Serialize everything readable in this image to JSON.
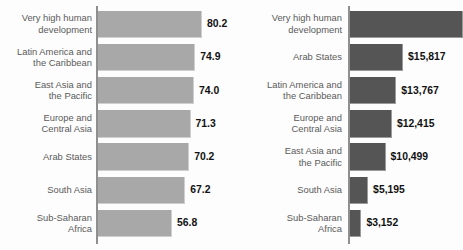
{
  "chart_data": [
    {
      "type": "bar",
      "id": "life-expectancy",
      "orientation": "horizontal",
      "title": "",
      "xlabel": "",
      "ylabel": "",
      "grid": false,
      "legend": null,
      "bar_color": "#a8a8a8",
      "axis_color": "#8f8f8f",
      "label_color": "#5b5b5b",
      "value_color": "#111111",
      "xlim": [
        0,
        80.2
      ],
      "categories": [
        "Very high human development",
        "Latin America and the Caribbean",
        "East Asia and the Pacific",
        "Europe and Central Asia",
        "Arab States",
        "South Asia",
        "Sub-Saharan Africa"
      ],
      "category_lines": [
        [
          "Very high human",
          "development"
        ],
        [
          "Latin America and",
          "the Caribbean"
        ],
        [
          "East Asia and",
          "the Pacific"
        ],
        [
          "Europe and",
          "Central Asia"
        ],
        [
          "Arab States"
        ],
        [
          "South Asia"
        ],
        [
          "Sub-Saharan",
          "Africa"
        ]
      ],
      "values": [
        80.2,
        74.9,
        74.0,
        71.3,
        70.2,
        67.2,
        56.8
      ],
      "value_labels": [
        "80.2",
        "74.9",
        "74.0",
        "71.3",
        "70.2",
        "67.2",
        "56.8"
      ]
    },
    {
      "type": "bar",
      "id": "gross-national-income-per-capita",
      "orientation": "horizontal",
      "title": "",
      "xlabel": "",
      "ylabel": "",
      "grid": false,
      "legend": null,
      "bar_color": "#555555",
      "axis_color": "#8f8f8f",
      "label_color": "#5b5b5b",
      "value_color": "#111111",
      "xlim": [
        0,
        34000
      ],
      "categories": [
        "Very high human development",
        "Arab States",
        "Latin America and the Caribbean",
        "Europe and Central Asia",
        "East Asia and the Pacific",
        "South Asia",
        "Sub-Saharan Africa"
      ],
      "category_lines": [
        [
          "Very high human",
          "development"
        ],
        [
          "Arab States"
        ],
        [
          "Latin America and",
          "the Caribbean"
        ],
        [
          "Europe and",
          "Central Asia"
        ],
        [
          "East Asia and",
          "the Pacific"
        ],
        [
          "South Asia"
        ],
        [
          "Sub-Saharan",
          "Africa"
        ]
      ],
      "values": [
        34000,
        15817,
        13767,
        12415,
        10499,
        5195,
        3152
      ],
      "value_labels": [
        "",
        "$15,817",
        "$13,767",
        "$12,415",
        "$10,499",
        "$5,195",
        "$3,152"
      ]
    }
  ]
}
